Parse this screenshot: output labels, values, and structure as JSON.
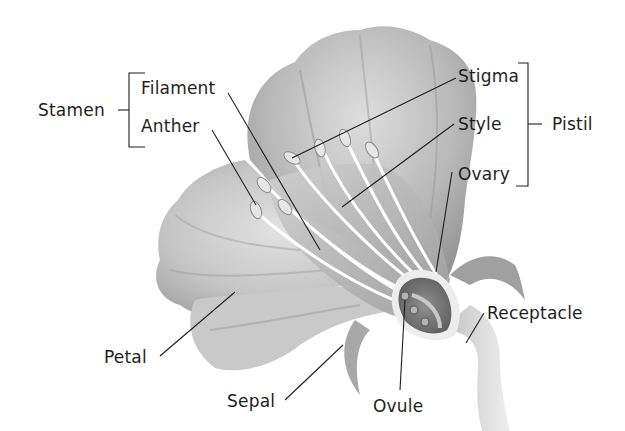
{
  "diagram": {
    "groups": [
      {
        "name": "Stamen",
        "members": [
          "Filament",
          "Anther"
        ]
      },
      {
        "name": "Pistil",
        "members": [
          "Stigma",
          "Style",
          "Ovary"
        ]
      }
    ],
    "labels": {
      "stamen": "Stamen",
      "filament": "Filament",
      "anther": "Anther",
      "stigma": "Stigma",
      "style": "Style",
      "ovary": "Ovary",
      "pistil": "Pistil",
      "petal": "Petal",
      "sepal": "Sepal",
      "ovule": "Ovule",
      "receptacle": "Receptacle"
    },
    "colors": {
      "background": "#ffffff",
      "petal_light": "#d6d6d6",
      "petal_mid": "#a9a9a9",
      "petal_dark": "#7a7a7a",
      "leader_line": "#1e1e1e",
      "text": "#1e1e1e"
    }
  }
}
